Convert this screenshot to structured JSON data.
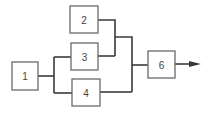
{
  "diagram": {
    "type": "reliability-block-diagram",
    "blocks": [
      {
        "id": "1",
        "label": "1"
      },
      {
        "id": "2",
        "label": "2"
      },
      {
        "id": "3",
        "label": "3"
      },
      {
        "id": "4",
        "label": "4"
      },
      {
        "id": "6",
        "label": "6"
      }
    ],
    "connections": [
      {
        "from": "1",
        "to": "3"
      },
      {
        "from": "1",
        "to": "4"
      },
      {
        "from": "2",
        "to": "junction-23"
      },
      {
        "from": "3",
        "to": "junction-23"
      },
      {
        "from": "junction-23",
        "to": "6"
      },
      {
        "from": "4",
        "to": "6"
      },
      {
        "from": "6",
        "to": "output"
      }
    ],
    "colors": {
      "line": "#3a3a3a",
      "box_border": "#6a6a6a",
      "text": "#444444",
      "background": "#ffffff"
    }
  }
}
